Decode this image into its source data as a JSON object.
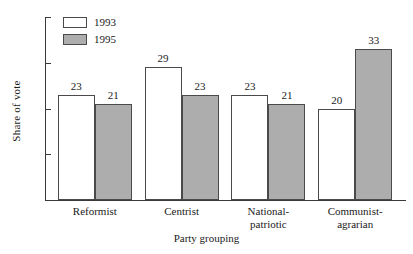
{
  "chart_data": {
    "type": "bar",
    "title": "",
    "xlabel": "Party grouping",
    "ylabel": "Share of vote",
    "ylim": [
      0,
      40
    ],
    "yticks": [
      0,
      10,
      20,
      30,
      40
    ],
    "grid": false,
    "legend_position": "top-left",
    "categories": [
      "Reformist",
      "National-patriotic",
      "Centrist",
      "Communist-agrarian"
    ],
    "category_lines": [
      [
        "Reformist"
      ],
      [
        "Centrist"
      ],
      [
        "National-",
        "patriotic"
      ],
      [
        "Communist-",
        "agrarian"
      ]
    ],
    "category_order": [
      "Reformist",
      "Centrist",
      "National-patriotic",
      "Communist-agrarian"
    ],
    "series": [
      {
        "name": "1993",
        "color": "#ffffff",
        "values": [
          23,
          29,
          23,
          20
        ],
        "labels": [
          "23",
          "29",
          "23",
          "20"
        ]
      },
      {
        "name": "1995",
        "color": "#adadad",
        "values": [
          21,
          23,
          21,
          33
        ],
        "labels": [
          "21",
          "23",
          "21",
          "33"
        ]
      }
    ]
  },
  "axis": {
    "ytick_labels": [
      "0",
      "10",
      "20",
      "30",
      "40"
    ],
    "ylabel": "Share of vote",
    "xlabel": "Party grouping"
  },
  "legend": {
    "items": [
      {
        "label": "1993",
        "color": "#ffffff"
      },
      {
        "label": "1995",
        "color": "#adadad"
      }
    ]
  },
  "colors": {
    "series_1993": "#ffffff",
    "series_1995": "#adadad",
    "axis": "#3a3a3a",
    "bar_border": "#4a4a4a",
    "background": "#ffffff"
  }
}
